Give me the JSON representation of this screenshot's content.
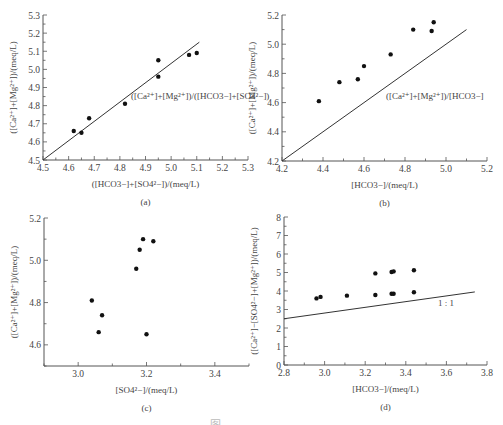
{
  "caption": "图 … … … …",
  "chart_data": [
    {
      "id": "a",
      "type": "scatter",
      "panel_label": "(a)",
      "xlabel": "([HCO3−]+[SO4²−])/(meq/L)",
      "ylabel": "([Ca²⁺]+[Mg²⁺])/(meq/L)",
      "xlim": [
        4.5,
        5.3
      ],
      "ylim": [
        4.5,
        5.3
      ],
      "xticks": [
        "4.5",
        "4.6",
        "4.7",
        "4.8",
        "4.9",
        "5.0",
        "5.1",
        "5.2",
        "5.3"
      ],
      "yticks": [
        "4.5",
        "4.6",
        "4.7",
        "4.8",
        "4.9",
        "5.0",
        "5.1",
        "5.2",
        "5.3"
      ],
      "annotation": "([Ca²⁺]+[Mg²⁺])/([HCO3−]+[SO4²−])",
      "reference_line": {
        "x": [
          4.5,
          5.11
        ],
        "y": [
          4.5,
          5.15
        ],
        "label": "1:1"
      },
      "points": {
        "x": [
          4.62,
          4.65,
          4.68,
          4.82,
          4.95,
          4.95,
          5.07,
          5.1
        ],
        "y": [
          4.66,
          4.65,
          4.73,
          4.81,
          5.05,
          4.96,
          5.08,
          5.09
        ]
      }
    },
    {
      "id": "b",
      "type": "scatter",
      "panel_label": "(b)",
      "xlabel": "[HCO3−]/(meq/L)",
      "ylabel": "([Ca²⁺]+[Mg²⁺])/(meq/L)",
      "xlim": [
        4.2,
        5.2
      ],
      "ylim": [
        4.2,
        5.2
      ],
      "xticks": [
        "4.2",
        "4.4",
        "4.6",
        "4.8",
        "5.0",
        "5.2"
      ],
      "yticks": [
        "4.2",
        "4.4",
        "4.6",
        "4.8",
        "5.0",
        "5.2"
      ],
      "annotation": "([Ca²⁺]+[Mg²⁺])/[HCO3−]",
      "reference_line": {
        "x": [
          4.2,
          5.1
        ],
        "y": [
          4.2,
          5.1
        ],
        "label": "1:1"
      },
      "points": {
        "x": [
          4.38,
          4.48,
          4.57,
          4.6,
          4.73,
          4.84,
          4.93,
          4.94
        ],
        "y": [
          4.61,
          4.74,
          4.76,
          4.85,
          4.93,
          5.1,
          5.09,
          5.15
        ]
      }
    },
    {
      "id": "c",
      "type": "scatter",
      "panel_label": "(c)",
      "xlabel": "[SO4²−]/(meq/L)",
      "ylabel": "([Ca²⁺]+[Mg²⁺])/(meq/L)",
      "xlim": [
        2.9,
        3.5
      ],
      "ylim": [
        4.5,
        5.2
      ],
      "xticks": [
        "3.0",
        "3.2",
        "3.4"
      ],
      "yticks": [
        "4.6",
        "4.8",
        "5.0",
        "5.2"
      ],
      "points": {
        "x": [
          3.04,
          3.06,
          3.07,
          3.17,
          3.18,
          3.19,
          3.22,
          3.2
        ],
        "y": [
          4.81,
          4.66,
          4.74,
          4.96,
          5.05,
          5.1,
          5.09,
          4.65
        ]
      }
    },
    {
      "id": "d",
      "type": "scatter",
      "panel_label": "(d)",
      "xlabel": "[HCO3−]/(meq/L)",
      "ylabel": "([Ca²⁺]−[SO4²−]+[Mg²⁺])/(meq/L)",
      "xlim": [
        2.8,
        3.8
      ],
      "ylim": [
        0,
        8
      ],
      "xticks": [
        "2.8",
        "3.0",
        "3.2",
        "3.4",
        "3.6",
        "3.8"
      ],
      "yticks": [
        "0",
        "1",
        "2",
        "3",
        "4",
        "5",
        "6",
        "7",
        "8"
      ],
      "annotation": "1 : 1",
      "reference_line": {
        "x": [
          2.8,
          3.74
        ],
        "y": [
          2.5,
          3.95
        ],
        "label": "1 : 1"
      },
      "points": {
        "x": [
          2.96,
          2.98,
          3.11,
          3.25,
          3.25,
          3.33,
          3.34,
          3.33,
          3.34,
          3.44,
          3.44
        ],
        "y": [
          3.6,
          3.68,
          3.75,
          3.78,
          4.95,
          3.85,
          3.85,
          5.03,
          5.06,
          3.93,
          5.12
        ]
      }
    }
  ],
  "layout": {
    "panels": {
      "a": {
        "x0": 43,
        "x1": 248,
        "y0": 160,
        "y1": 15
      },
      "b": {
        "x0": 282,
        "x1": 487,
        "y0": 161,
        "y1": 15
      },
      "c": {
        "x0": 44,
        "x1": 249,
        "y0": 366,
        "y1": 218
      },
      "d": {
        "x0": 284,
        "x1": 487,
        "y0": 365,
        "y1": 217
      }
    },
    "colors": {
      "axis": "#555555",
      "point": "#111111",
      "line": "#333333",
      "text": "#444444"
    }
  }
}
